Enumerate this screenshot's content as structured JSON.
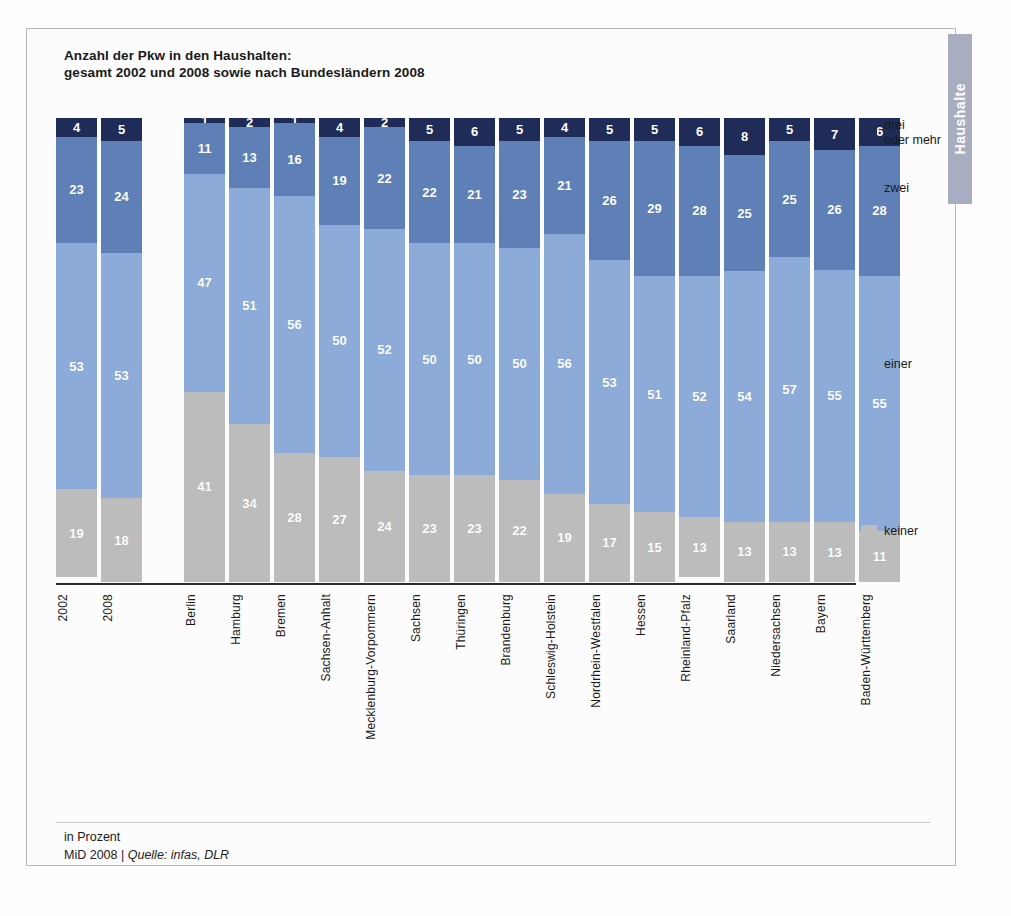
{
  "side_tab": {
    "label": "Haushalte"
  },
  "title": {
    "line1": "Anzahl der Pkw in den Haushalten:",
    "line2": "gesamt 2002 und 2008 sowie nach Bundesländern 2008"
  },
  "footer": {
    "unit": "in Prozent",
    "source_prefix": "MiD 2008 | ",
    "source_italic": "Quelle: infas, DLR"
  },
  "legend": {
    "items": [
      {
        "label": "drei\noder mehr",
        "color": "#1f2c57",
        "key": "drei_oder_mehr"
      },
      {
        "label": "zwei",
        "color": "#5e80b6",
        "key": "zwei"
      },
      {
        "label": "einer",
        "color": "#8cabd8",
        "key": "einer"
      },
      {
        "label": "keiner",
        "color": "#bcbcbc",
        "key": "keiner"
      }
    ]
  },
  "chart_data": {
    "type": "bar",
    "subtype": "stacked-column-100",
    "title": "Anzahl der Pkw in den Haushalten: gesamt 2002 und 2008 sowie nach Bundesländern 2008",
    "xlabel": "",
    "ylabel": "in Prozent",
    "ylim": [
      0,
      100
    ],
    "grid": false,
    "legend_position": "right",
    "stack_order_bottom_to_top": [
      "keiner",
      "einer",
      "zwei",
      "drei_oder_mehr"
    ],
    "colors": {
      "keiner": "#bcbcbc",
      "einer": "#8cabd8",
      "zwei": "#5e80b6",
      "drei_oder_mehr": "#1f2c57"
    },
    "groups": [
      {
        "name": "gesamt",
        "categories": [
          "2002",
          "2008"
        ],
        "series": [
          {
            "name": "drei oder mehr",
            "key": "drei_oder_mehr",
            "values": [
              4,
              5
            ]
          },
          {
            "name": "zwei",
            "key": "zwei",
            "values": [
              23,
              24
            ]
          },
          {
            "name": "einer",
            "key": "einer",
            "values": [
              53,
              53
            ]
          },
          {
            "name": "keiner",
            "key": "keiner",
            "values": [
              19,
              18
            ]
          }
        ]
      },
      {
        "name": "Bundesländer 2008",
        "categories": [
          "Berlin",
          "Hamburg",
          "Bremen",
          "Sachsen-Anhalt",
          "Mecklenburg-Vorpommern",
          "Sachsen",
          "Thüringen",
          "Brandenburg",
          "Schleswig-Holstein",
          "Nordrhein-Westfalen",
          "Hessen",
          "Rheinland-Pfalz",
          "Saarland",
          "Niedersachsen",
          "Bayern",
          "Baden-Württemberg"
        ],
        "series": [
          {
            "name": "drei oder mehr",
            "key": "drei_oder_mehr",
            "values": [
              1,
              2,
              1,
              4,
              2,
              5,
              6,
              5,
              4,
              5,
              5,
              6,
              8,
              5,
              7,
              6
            ]
          },
          {
            "name": "zwei",
            "key": "zwei",
            "values": [
              11,
              13,
              16,
              19,
              22,
              22,
              21,
              23,
              21,
              26,
              29,
              28,
              25,
              25,
              26,
              28
            ]
          },
          {
            "name": "einer",
            "key": "einer",
            "values": [
              47,
              51,
              56,
              50,
              52,
              50,
              50,
              50,
              56,
              53,
              51,
              52,
              54,
              57,
              55,
              55
            ]
          },
          {
            "name": "keiner",
            "key": "keiner",
            "values": [
              41,
              34,
              28,
              27,
              24,
              23,
              23,
              22,
              19,
              17,
              15,
              13,
              13,
              13,
              13,
              11
            ]
          }
        ]
      }
    ]
  }
}
